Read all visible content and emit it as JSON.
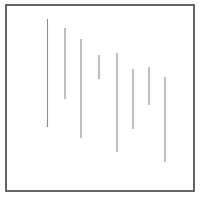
{
  "figure": {
    "background_color": "#ffffff",
    "frame": {
      "name": "outer-border",
      "x": 6,
      "y": 5,
      "width": 188,
      "height": 186,
      "stroke_color": "#3c3c3c",
      "stroke_width": 1.6,
      "fill_color": "#ffffff"
    },
    "line_style": {
      "stroke_color": "#8a8a8a",
      "stroke_width": 1.1
    },
    "segments": [
      {
        "id": 1,
        "label": "segment-1",
        "x": 47.5,
        "y_top": 19,
        "y_bottom": 127,
        "length": 108
      },
      {
        "id": 2,
        "label": "segment-2",
        "x": 65.0,
        "y_top": 28,
        "y_bottom": 99,
        "length": 71
      },
      {
        "id": 3,
        "label": "segment-3",
        "x": 81.0,
        "y_top": 39,
        "y_bottom": 138,
        "length": 99
      },
      {
        "id": 4,
        "label": "segment-4",
        "x": 99.0,
        "y_top": 55,
        "y_bottom": 79,
        "length": 24
      },
      {
        "id": 5,
        "label": "segment-5",
        "x": 117.0,
        "y_top": 53,
        "y_bottom": 152,
        "length": 99
      },
      {
        "id": 6,
        "label": "segment-6",
        "x": 133.0,
        "y_top": 69,
        "y_bottom": 129,
        "length": 60
      },
      {
        "id": 7,
        "label": "segment-7",
        "x": 149.0,
        "y_top": 67,
        "y_bottom": 105,
        "length": 38
      },
      {
        "id": 8,
        "label": "segment-8",
        "x": 165.0,
        "y_top": 77,
        "y_bottom": 162,
        "length": 85
      }
    ]
  },
  "chart_data": {
    "type": "line",
    "xlabel": "",
    "ylabel": "",
    "grid": false,
    "legend": "none",
    "xlim": [
      6,
      194
    ],
    "ylim": [
      5,
      191
    ],
    "x": [
      47.5,
      65,
      81,
      99,
      117,
      133,
      149,
      165
    ],
    "series": [
      {
        "name": "top",
        "values": [
          19,
          28,
          39,
          55,
          53,
          69,
          67,
          77
        ]
      },
      {
        "name": "bottom",
        "values": [
          127,
          99,
          138,
          79,
          152,
          129,
          105,
          162
        ]
      },
      {
        "name": "length",
        "values": [
          108,
          71,
          99,
          24,
          99,
          60,
          38,
          85
        ]
      }
    ]
  }
}
